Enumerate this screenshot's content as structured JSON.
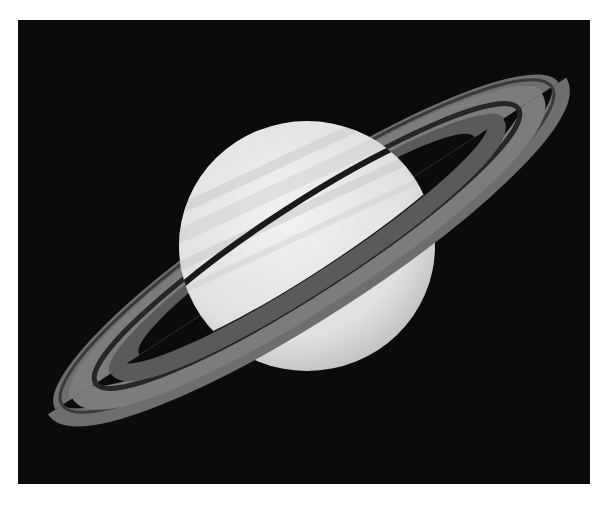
{
  "image": {
    "subject": "Saturn with rings",
    "background_color": "#0b0b0b",
    "planet_color": "#e6e6e6",
    "ring_color": "#7a7a7a",
    "gap_color": "#2a2a2a"
  }
}
